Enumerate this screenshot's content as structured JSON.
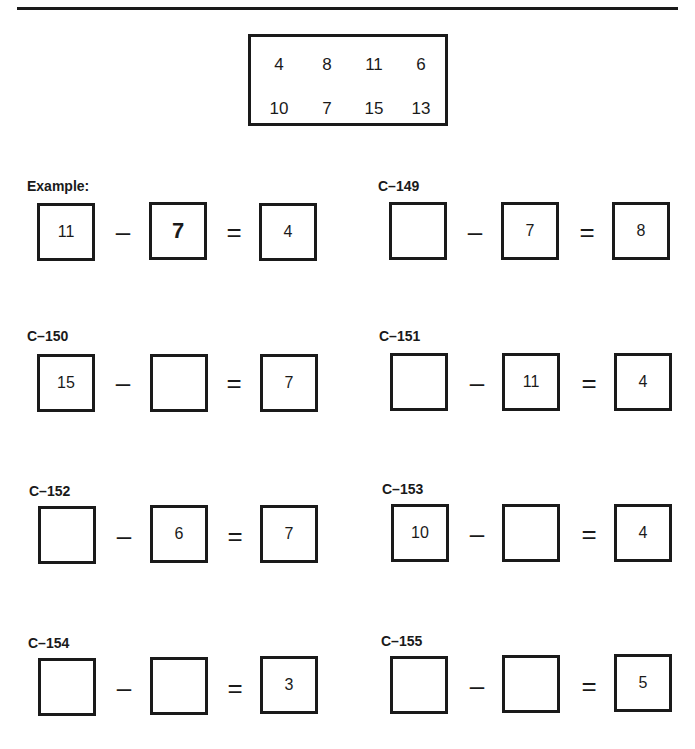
{
  "number_bank": {
    "rows": [
      [
        "4",
        "8",
        "11",
        "6"
      ],
      [
        "10",
        "7",
        "15",
        "13"
      ]
    ]
  },
  "problems": [
    {
      "label": "Example:",
      "a": "11",
      "b": "7",
      "c": "4",
      "minus": "–",
      "equals": "="
    },
    {
      "label": "C–149",
      "a": "",
      "b": "7",
      "c": "8",
      "minus": "–",
      "equals": "="
    },
    {
      "label": "C–150",
      "a": "15",
      "b": "",
      "c": "7",
      "minus": "–",
      "equals": "="
    },
    {
      "label": "C–151",
      "a": "",
      "b": "11",
      "c": "4",
      "minus": "–",
      "equals": "="
    },
    {
      "label": "C–152",
      "a": "",
      "b": "6",
      "c": "7",
      "minus": "–",
      "equals": "="
    },
    {
      "label": "C–153",
      "a": "10",
      "b": "",
      "c": "4",
      "minus": "–",
      "equals": "="
    },
    {
      "label": "C–154",
      "a": "",
      "b": "",
      "c": "3",
      "minus": "–",
      "equals": "="
    },
    {
      "label": "C–155",
      "a": "",
      "b": "",
      "c": "5",
      "minus": "–",
      "equals": "="
    }
  ]
}
